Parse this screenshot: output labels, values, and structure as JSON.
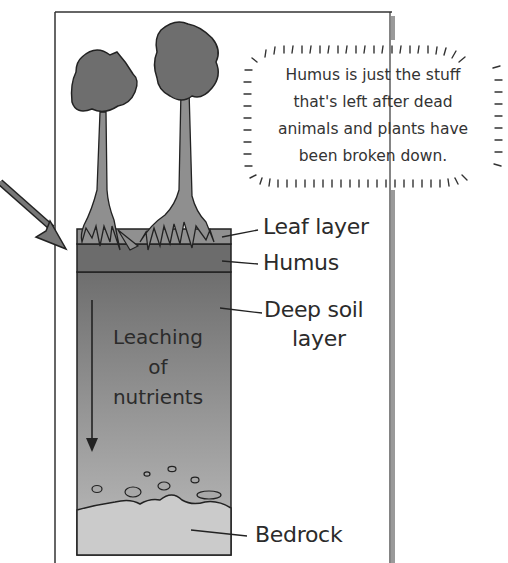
{
  "diagram": {
    "callout": {
      "lines": [
        "Humus is just the stuff",
        "that's left after dead",
        "animals and plants have",
        "been broken down."
      ]
    },
    "layers": [
      {
        "id": "leaf",
        "label": "Leaf layer",
        "color": "#8e8e8e"
      },
      {
        "id": "humus",
        "label": "Humus",
        "color": "#6c6c6c"
      },
      {
        "id": "deep-soil",
        "label_line1": "Deep soil",
        "label_line2": "layer",
        "color": "#7a7a7a"
      },
      {
        "id": "bedrock",
        "label": "Bedrock",
        "color": "#c9c9c9"
      }
    ],
    "leaching": {
      "line1": "Leaching",
      "line2": "of",
      "line3": "nutrients"
    },
    "colors": {
      "canopy": "#6e6e6e",
      "trunk": "#8f8f8f",
      "outline": "#222222",
      "frame_edge": "#9a9a9a"
    }
  }
}
